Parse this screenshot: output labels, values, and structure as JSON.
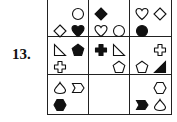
{
  "problem": {
    "number_label": "13.",
    "grid": {
      "rows": 3,
      "cols": 3,
      "cells": [
        [
          {
            "shapes": [
              {
                "type": "circle",
                "fill": "outline",
                "pos": "top-right"
              },
              {
                "type": "diamond",
                "fill": "outline",
                "pos": "bottom-left"
              },
              {
                "type": "heart",
                "fill": "solid",
                "pos": "bottom-right"
              }
            ]
          },
          {
            "shapes": [
              {
                "type": "diamond",
                "fill": "solid",
                "pos": "top-left"
              },
              {
                "type": "heart",
                "fill": "outline",
                "pos": "bottom-left"
              },
              {
                "type": "circle",
                "fill": "outline",
                "pos": "bottom-right"
              }
            ]
          },
          {
            "shapes": [
              {
                "type": "heart",
                "fill": "outline",
                "pos": "top-left"
              },
              {
                "type": "diamond",
                "fill": "outline",
                "pos": "top-right"
              },
              {
                "type": "circle",
                "fill": "solid",
                "pos": "bottom-left"
              }
            ]
          }
        ],
        [
          {
            "shapes": [
              {
                "type": "right-triangle",
                "fill": "outline",
                "pos": "top-left"
              },
              {
                "type": "pentagon",
                "fill": "solid",
                "pos": "top-right"
              },
              {
                "type": "cross",
                "fill": "outline",
                "pos": "bottom-left"
              }
            ]
          },
          {
            "shapes": [
              {
                "type": "cross",
                "fill": "solid",
                "pos": "top-left"
              },
              {
                "type": "right-triangle",
                "fill": "outline",
                "pos": "top-right"
              },
              {
                "type": "pentagon",
                "fill": "outline",
                "pos": "bottom-right"
              }
            ]
          },
          {
            "shapes": [
              {
                "type": "cross",
                "fill": "outline",
                "pos": "top-right"
              },
              {
                "type": "pentagon",
                "fill": "outline",
                "pos": "bottom-left"
              },
              {
                "type": "right-triangle",
                "fill": "solid",
                "pos": "bottom-right"
              }
            ]
          }
        ],
        [
          {
            "shapes": [
              {
                "type": "drop",
                "fill": "outline",
                "pos": "top-left"
              },
              {
                "type": "chevron",
                "fill": "outline",
                "pos": "top-right"
              },
              {
                "type": "hexagon",
                "fill": "solid",
                "pos": "bottom-left"
              }
            ]
          },
          {
            "shapes": []
          },
          {
            "shapes": [
              {
                "type": "hexagon",
                "fill": "outline",
                "pos": "top-right"
              },
              {
                "type": "chevron",
                "fill": "solid",
                "pos": "bottom-left"
              },
              {
                "type": "drop",
                "fill": "outline",
                "pos": "bottom-right"
              }
            ]
          }
        ]
      ]
    }
  }
}
